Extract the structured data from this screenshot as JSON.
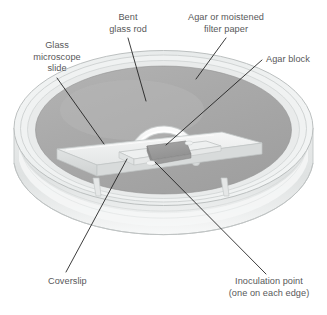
{
  "figure": {
    "background_color": "#ffffff",
    "label_color": "#58585a",
    "leader_color": "#1a1a1a"
  },
  "labels": [
    {
      "name": "bent-glass-rod",
      "lines": [
        "Bent",
        "glass rod"
      ],
      "line1": "Bent",
      "line2": "glass rod"
    },
    {
      "name": "agar-or-moistened-filter-paper",
      "lines": [
        "Agar or moistened",
        "filter paper"
      ],
      "line1": "Agar or moistened",
      "line2": "filter paper"
    },
    {
      "name": "glass-microscope-slide",
      "lines": [
        "Glass",
        "microscope",
        "slide"
      ],
      "line1": "Glass",
      "line2": "microscope",
      "line3": "slide"
    },
    {
      "name": "agar-block",
      "lines": [
        "Agar block"
      ],
      "line1": "Agar block"
    },
    {
      "name": "coverslip",
      "lines": [
        "Coverslip"
      ],
      "line1": "Coverslip"
    },
    {
      "name": "inoculation-point",
      "lines": [
        "Inoculation point",
        "(one on each edge)"
      ],
      "line1": "Inoculation point",
      "line2": "(one on each edge)"
    }
  ],
  "colors": {
    "agar_surface": "#a8a8a8",
    "agar_surface_light": "#b6b6b6",
    "dish_wall": "#e2e4e4",
    "dish_wall_shadow": "#cdd0d0",
    "dish_rim": "#eef0f0",
    "slide_top": "#f2f3f3",
    "slide_face": "#dcdede",
    "coverslip": "#e9ebeb",
    "agar_block": "#9d9d9d",
    "glass_rod": "#f4f5f5",
    "outline": "#b9bdbd"
  }
}
